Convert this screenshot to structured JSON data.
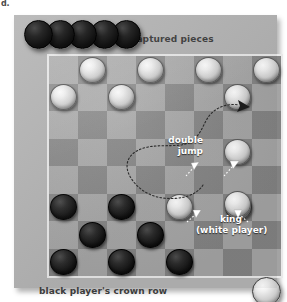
{
  "figure": {
    "corner_fragment": "d.",
    "background_color": "#ffffff",
    "panel_color": "#b4b4b4",
    "board_light_color": "#adadad",
    "board_dark_color": "#8a8a8a",
    "annotation_color": "#ffffff",
    "label_color": "#3c3c3c"
  },
  "labels": {
    "captured_pieces": "captured pieces",
    "crown_row": "black player's crown row",
    "double_jump_line1": "double",
    "double_jump_line2": "jump",
    "king_line1": "king",
    "king_line2": "(white player)"
  },
  "board": {
    "rows": 8,
    "columns": 8,
    "squares": [
      [
        "light",
        "dark",
        "light",
        "dark",
        "light",
        "dark",
        "light",
        "dark"
      ],
      [
        "dark",
        "light",
        "dark",
        "light",
        "dark",
        "light",
        "dark",
        "light"
      ],
      [
        "light",
        "dark",
        "light",
        "dark",
        "light",
        "dark",
        "light",
        "dark"
      ],
      [
        "dark",
        "light",
        "dark",
        "light",
        "dark",
        "light",
        "dark",
        "light"
      ],
      [
        "light",
        "dark",
        "light",
        "dark",
        "light",
        "dark",
        "light",
        "dark"
      ],
      [
        "dark",
        "light",
        "dark",
        "light",
        "dark",
        "light",
        "dark",
        "light"
      ],
      [
        "light",
        "dark",
        "light",
        "dark",
        "light",
        "dark",
        "light",
        "dark"
      ],
      [
        "dark",
        "light",
        "dark",
        "light",
        "dark",
        "light",
        "dark",
        "light"
      ]
    ],
    "pieces": [
      {
        "row": 0,
        "col": 1,
        "color": "white",
        "king": false
      },
      {
        "row": 0,
        "col": 3,
        "color": "white",
        "king": false
      },
      {
        "row": 0,
        "col": 5,
        "color": "white",
        "king": false
      },
      {
        "row": 0,
        "col": 7,
        "color": "white",
        "king": false
      },
      {
        "row": 1,
        "col": 0,
        "color": "white",
        "king": false
      },
      {
        "row": 1,
        "col": 2,
        "color": "white",
        "king": false
      },
      {
        "row": 1,
        "col": 6,
        "color": "white",
        "king": false
      },
      {
        "row": 3,
        "col": 6,
        "color": "white",
        "king": false
      },
      {
        "row": 5,
        "col": 0,
        "color": "black",
        "king": false
      },
      {
        "row": 5,
        "col": 2,
        "color": "black",
        "king": false
      },
      {
        "row": 5,
        "col": 4,
        "color": "white",
        "king": false
      },
      {
        "row": 5,
        "col": 6,
        "color": "white",
        "king": true
      },
      {
        "row": 6,
        "col": 1,
        "color": "black",
        "king": false
      },
      {
        "row": 6,
        "col": 3,
        "color": "black",
        "king": false
      },
      {
        "row": 7,
        "col": 0,
        "color": "black",
        "king": false
      },
      {
        "row": 7,
        "col": 2,
        "color": "black",
        "king": false
      },
      {
        "row": 7,
        "col": 4,
        "color": "black",
        "king": false
      }
    ]
  },
  "captured": {
    "black_count": 5,
    "white_offboard_count": 1
  },
  "annotations": {
    "double_jump_path": "dashed curve from king square sweeping left then arcing up and right to top-right dark square",
    "arrow_count": 5
  }
}
